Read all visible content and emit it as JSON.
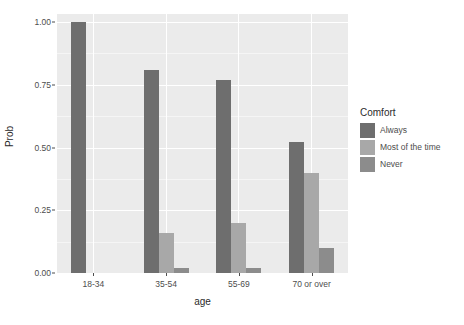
{
  "chart_data": {
    "type": "bar",
    "title": "",
    "xlabel": "age",
    "ylabel": "Prob",
    "categories": [
      "18-34",
      "35-54",
      "55-69",
      "70 or over"
    ],
    "series": [
      {
        "name": "Always",
        "color": "#6e6e6e",
        "values": [
          1.0,
          0.81,
          0.77,
          0.52
        ]
      },
      {
        "name": "Most of the time",
        "color": "#a8a8a8",
        "values": [
          0.0,
          0.16,
          0.2,
          0.4
        ]
      },
      {
        "name": "Never",
        "color": "#8c8c8c",
        "values": [
          0.0,
          0.02,
          0.02,
          0.1
        ]
      }
    ],
    "ylim": [
      0,
      1.0
    ],
    "yticks": [
      0.0,
      0.25,
      0.5,
      0.75,
      1.0
    ],
    "ytick_labels": [
      "0.00",
      "0.25",
      "0.50",
      "0.75",
      "1.00"
    ],
    "grid": true,
    "panel_background": "#ebebeb",
    "gridline_color": "#ffffff",
    "legend": {
      "title": "Comfort",
      "position": "right",
      "entries": [
        "Always",
        "Most of the time",
        "Never"
      ]
    }
  }
}
